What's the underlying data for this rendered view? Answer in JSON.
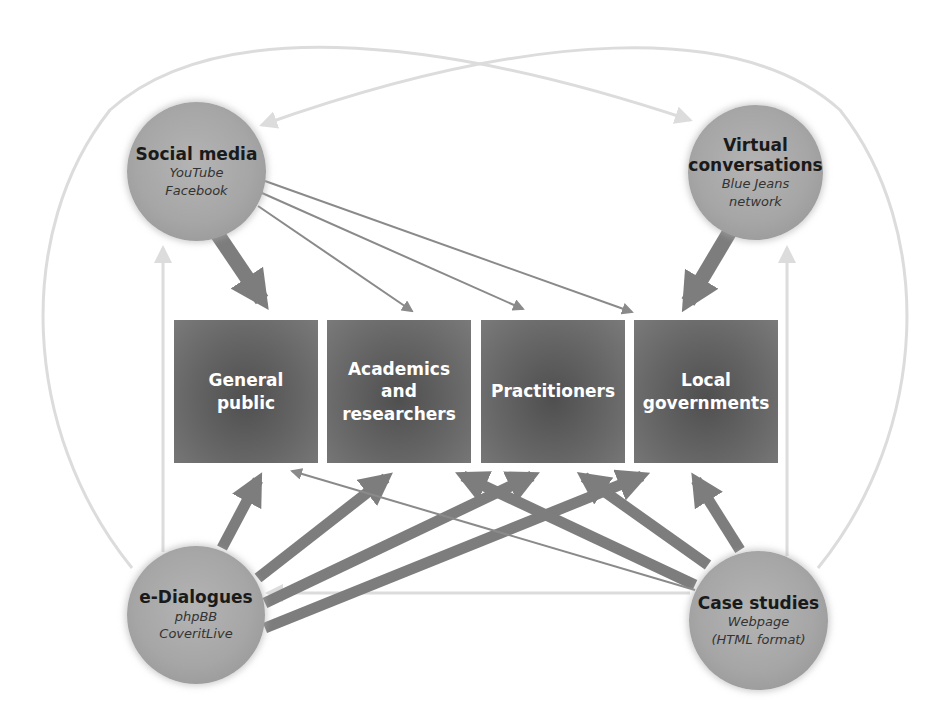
{
  "diagram": {
    "colors": {
      "box_fill": "#666666",
      "node_fill": "#a8a8a8",
      "strong_arrow": "#7d7d7d",
      "thin_arrow": "#8a8a8a",
      "faint_arrow": "#dcdcdc",
      "box_text": "#ffffff",
      "node_text": "#1a1a1a"
    },
    "audiences": [
      {
        "id": "general-public",
        "label": "General\npublic"
      },
      {
        "id": "academics",
        "label": "Academics\nand\nresearchers"
      },
      {
        "id": "practitioners",
        "label": "Practitioners"
      },
      {
        "id": "local-governments",
        "label": "Local\ngovernments"
      }
    ],
    "channels": [
      {
        "id": "social-media",
        "title": "Social media",
        "subtitle": "YouTube\nFacebook"
      },
      {
        "id": "virtual-conversations",
        "title": "Virtual\nconversations",
        "subtitle": "Blue Jeans\nnetwork"
      },
      {
        "id": "e-dialogues",
        "title": "e-Dialogues",
        "subtitle": "phpBB\nCoveritLive"
      },
      {
        "id": "case-studies",
        "title": "Case studies",
        "subtitle": "Webpage\n(HTML format)"
      }
    ],
    "edges": [
      {
        "from": "social-media",
        "to": "general-public",
        "weight": "strong"
      },
      {
        "from": "social-media",
        "to": "academics",
        "weight": "thin"
      },
      {
        "from": "social-media",
        "to": "practitioners",
        "weight": "thin"
      },
      {
        "from": "social-media",
        "to": "local-governments",
        "weight": "thin"
      },
      {
        "from": "virtual-conversations",
        "to": "local-governments",
        "weight": "strong"
      },
      {
        "from": "e-dialogues",
        "to": "general-public",
        "weight": "medium"
      },
      {
        "from": "e-dialogues",
        "to": "academics",
        "weight": "medium"
      },
      {
        "from": "e-dialogues",
        "to": "practitioners",
        "weight": "medium"
      },
      {
        "from": "e-dialogues",
        "to": "local-governments",
        "weight": "medium"
      },
      {
        "from": "case-studies",
        "to": "general-public",
        "weight": "thin"
      },
      {
        "from": "case-studies",
        "to": "academics",
        "weight": "medium"
      },
      {
        "from": "case-studies",
        "to": "practitioners",
        "weight": "medium"
      },
      {
        "from": "case-studies",
        "to": "local-governments",
        "weight": "medium"
      },
      {
        "from": "e-dialogues",
        "to": "social-media",
        "weight": "faint"
      },
      {
        "from": "case-studies",
        "to": "virtual-conversations",
        "weight": "faint"
      },
      {
        "from": "case-studies",
        "to": "e-dialogues",
        "weight": "faint"
      },
      {
        "from": "e-dialogues",
        "to": "virtual-conversations",
        "weight": "faint"
      },
      {
        "from": "case-studies",
        "to": "social-media",
        "weight": "faint"
      }
    ]
  }
}
